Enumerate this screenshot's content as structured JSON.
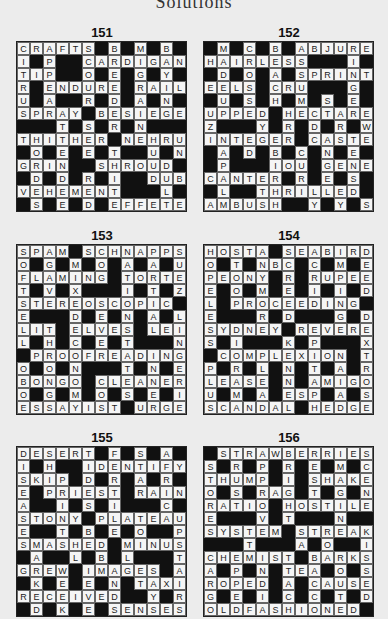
{
  "header": "Solutions",
  "puzzles": [
    {
      "number": "151",
      "rows": [
        "CRAFTS#B#M#B#",
        "I#P##CARDIGAN",
        "TIP##O#E#G#Y#",
        "R#ENDURE#RAIL",
        "U#A##R#D#A#N#",
        "SPRAY#BESIEGE",
        "###T#S#R#N###",
        "THITHER#NEHRU",
        "#O#E#E#T##U#N",
        "GRIN##SHROUD#",
        "#D#D#R#I##DUB",
        "VEHEMENT###L#",
        "#S#E#D#EFFETE"
      ]
    },
    {
      "number": "152",
      "rows": [
        "#M#C#B#ABJURE",
        "HAIRLESS###I#",
        "#D#O#A#SPRINT",
        "EELS#CRU###G#",
        "#U#S#H#M#S#E#",
        "UPPED#HECTARE",
        "Z###Y#R#D#R#W",
        "INTEGER#CASTE",
        "#A#D#B#C#N#E#",
        "#P###IOU#GENE",
        "CANTER#R#E#S#",
        "#L##THRILLED#",
        "AMBUSH##Y#Y#S"
      ]
    },
    {
      "number": "153",
      "rows": [
        "SPAM#SCHNAPPS",
        "O#G#M#O#A#A#U",
        "FLAMING#TORTE",
        "T#V#X###I#T#Z",
        "STEREOSCOPIC#",
        "E###D#E#N#A#L",
        "LIT#ELVES#LEI",
        "L#H#C#E#T###N",
        "#PROOFREADING",
        "O#O#N###T#N#E",
        "BONGO#CLEANER",
        "O#G#M#O#S#E#I",
        "ESSAYIST#URGE"
      ]
    },
    {
      "number": "154",
      "rows": [
        "HOSTA#SEABIRD",
        "O#T#NBC#C#M#E",
        "PEONY#R#RUPEE",
        "E#O#M#E#I#I#D",
        "L#PROCEEDING#",
        "E###R#D###G#D",
        "SYDNEY#REVERE",
        "S#I###K#P###X",
        "#COMPLEXION#T",
        "P#R#L#N#T#A#R",
        "LEASE#N#AMIGO",
        "U#M#A#ESP#A#S",
        "SCANDAL#HEDGE"
      ]
    },
    {
      "number": "155",
      "rows": [
        "DESERT#F#S#A#",
        "I#H##IDENTIFY",
        "SKIP#D#R#A#R#",
        "E#PRIEST#RAIN",
        "A##I#S#I###C#",
        "STONY#PLATEAU",
        "E##T#B#E#O##P",
        "SMASHED#MINUS",
        "#A##L#B#L###T",
        "GREW#IMAGES#A",
        "#K#E#E#N#TAXI",
        "RECEIVED##Y#R",
        "#D#K#E#SENSES"
      ]
    },
    {
      "number": "156",
      "rows": [
        "#STRAWBERRIES",
        "S#R#P#R#E#M#C",
        "THUMP#I#SHAKE",
        "O#S#RAG#T#G#N",
        "RATIO#HOSTILE",
        "E###V#T###N##",
        "SYSTEM#STREAK",
        "###T###A#O##I",
        "CHEMIST#BARKS",
        "A#P#N#TEA#O#S",
        "ROPED#A#CAUSE",
        "G#E#I#C#C#T#D",
        "OLDFASHIONED#"
      ]
    }
  ]
}
